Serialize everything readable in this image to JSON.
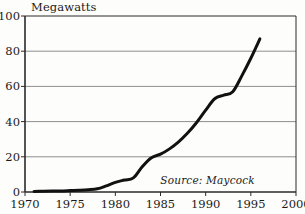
{
  "chart_data": {
    "type": "line",
    "title": "Megawatts",
    "xlabel": "",
    "ylabel": "Megawatts",
    "xlim": [
      1970,
      2000
    ],
    "ylim": [
      0,
      100
    ],
    "grid": true,
    "legend": null,
    "yticks": [
      0,
      20,
      40,
      60,
      80,
      100
    ],
    "ytick_labels": [
      "0",
      "20",
      "40",
      "60",
      "80",
      "100"
    ],
    "xticks": [
      1970,
      1975,
      1980,
      1985,
      1990,
      1995,
      2000
    ],
    "xtick_labels": [
      "1970",
      "1975",
      "1980",
      "1985",
      "1990",
      "1995",
      "2000"
    ],
    "annotations": [
      {
        "text": "Source: Maycock",
        "x": 1992.5,
        "y": 6,
        "style": "italic"
      }
    ],
    "series": [
      {
        "name": "Photovoltaic shipments",
        "color": "#111111",
        "line_width": 3,
        "x": [
          1971,
          1972,
          1973,
          1974,
          1975,
          1976,
          1977,
          1978,
          1979,
          1980,
          1981,
          1982,
          1983,
          1984,
          1985,
          1986,
          1987,
          1988,
          1989,
          1990,
          1991,
          1992,
          1993,
          1994,
          1995,
          1996
        ],
        "values": [
          0.3,
          0.4,
          0.5,
          0.6,
          0.8,
          1.0,
          1.3,
          1.8,
          3.5,
          5.5,
          6.8,
          8.0,
          14.5,
          19.5,
          21.5,
          24.5,
          28.5,
          33.5,
          39.5,
          46.5,
          53.0,
          55.0,
          57.0,
          66.0,
          76.0,
          87.0
        ]
      }
    ]
  }
}
